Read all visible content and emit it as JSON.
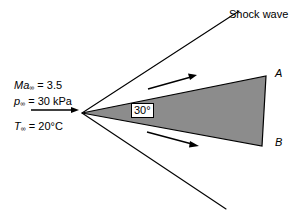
{
  "figure": {
    "background_color": "#ffffff",
    "line_color": "#000000",
    "wedge_fill_color": "#8c8c8c"
  },
  "annotations": {
    "shock_wave_label": "Shock wave",
    "wedge_half_angle_label": "30°",
    "point_a_label": "A",
    "point_b_label": "B"
  },
  "freestream": {
    "mach_symbol": "Ma",
    "mach_subscript": "∞",
    "mach_equals": " = 3.5",
    "pressure_symbol": "p",
    "pressure_subscript": "∞",
    "pressure_equals": " = 30 kPa",
    "temperature_symbol": "T",
    "temperature_subscript": "∞",
    "temperature_equals": " = 20°C",
    "mach_value": "3.5",
    "pressure_value": "30 kPa",
    "temperature_value": "20°C"
  },
  "geometry": {
    "apex": [
      82,
      113
    ],
    "wedge_top_right": [
      266,
      76
    ],
    "wedge_bottom_right": [
      262,
      146
    ],
    "shock_upper_end": [
      239,
      11
    ],
    "shock_lower_end": [
      226,
      209
    ],
    "freestream_arrow_start": [
      31,
      110
    ],
    "freestream_arrow_end": [
      79,
      110
    ],
    "flow_arrow_upper_start": [
      148,
      89
    ],
    "flow_arrow_upper_end": [
      197,
      75
    ],
    "flow_arrow_lower_start": [
      147,
      132
    ],
    "flow_arrow_lower_end": [
      199,
      146
    ]
  }
}
